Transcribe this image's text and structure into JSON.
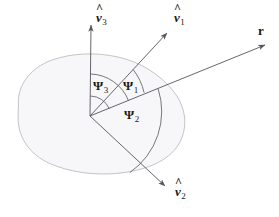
{
  "figure": {
    "background_color": "#ffffff",
    "blob": {
      "fill_color": "#f7f7f9",
      "stroke_color": "#b9b9bf",
      "stroke_width": 0.8
    },
    "line_color": "#55555c",
    "arc_color": "#55555c",
    "text_color": "#1a1a1a",
    "origin": {
      "x": 90,
      "y": 116
    }
  },
  "vectors": [
    {
      "id": "v3",
      "label_hat": "^",
      "label_base": "v",
      "label_sub": "3",
      "tip": {
        "x": 91,
        "y": 22
      },
      "label_pos": {
        "x": 96,
        "y": 12
      }
    },
    {
      "id": "v1",
      "label_hat": "^",
      "label_base": "v",
      "label_sub": "1",
      "tip": {
        "x": 171,
        "y": 29
      },
      "label_pos": {
        "x": 174,
        "y": 12
      }
    },
    {
      "id": "v2",
      "label_hat": "^",
      "label_base": "v",
      "label_sub": "2",
      "tip": {
        "x": 169,
        "y": 190
      },
      "label_pos": {
        "x": 174,
        "y": 186
      }
    },
    {
      "id": "r",
      "label_base": "r",
      "tip": {
        "x": 269,
        "y": 43
      },
      "label_pos": {
        "x": 258,
        "y": 25
      }
    }
  ],
  "angles": [
    {
      "id": "psi3",
      "symbol": "Ψ",
      "sub": "3",
      "label_pos": {
        "x": 93,
        "y": 80
      },
      "description": "angle between v3-hat and r"
    },
    {
      "id": "psi1",
      "symbol": "Ψ",
      "sub": "1",
      "label_pos": {
        "x": 123,
        "y": 80
      },
      "description": "angle between v1-hat and r"
    },
    {
      "id": "psi2",
      "symbol": "Ψ",
      "sub": "2",
      "label_pos": {
        "x": 124,
        "y": 109
      },
      "description": "angle between r and v2-hat"
    }
  ]
}
